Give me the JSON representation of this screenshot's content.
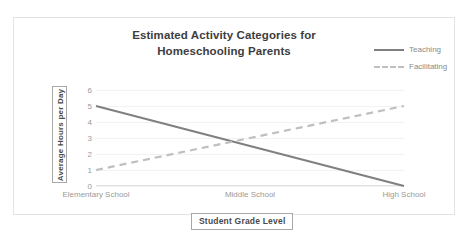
{
  "chart_data": {
    "type": "line",
    "title": "Estimated Activity Categories for Homeschooling Parents",
    "title_line_1": "Estimated Activity Categories for",
    "title_line_2": "Homeschooling Parents",
    "xlabel": "Student Grade Level",
    "ylabel": "Average Hours per Day",
    "categories": [
      "Elementary School",
      "Middle School",
      "High School"
    ],
    "yticks": [
      6,
      5,
      4,
      3,
      2,
      1,
      0
    ],
    "ylim": [
      0,
      6
    ],
    "grid": true,
    "legend_position": "top-right",
    "series": [
      {
        "name": "Teaching",
        "values": [
          5,
          2.5,
          0
        ],
        "style": "solid",
        "color": "#808080"
      },
      {
        "name": "Facilitating",
        "values": [
          1,
          3,
          5
        ],
        "style": "dashed",
        "color": "#bfbfbf"
      }
    ]
  },
  "colors": {
    "teaching": "#808080",
    "facilitating": "#bfbfbf",
    "title_text": "#3d3d3d",
    "tick_text": "#9a9a9a",
    "frame_border": "#e3e3e3",
    "axis_title_border": "#a8a8a8",
    "gridline": "#f2f2f2"
  }
}
